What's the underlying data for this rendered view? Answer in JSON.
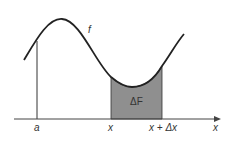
{
  "diagram": {
    "curve_label": "f",
    "area_label": "ΔF",
    "axis_label": "x",
    "ticks": [
      {
        "label": "a",
        "x": 37
      },
      {
        "label": "x",
        "x": 111
      },
      {
        "label": "x + Δx",
        "x": 162
      }
    ],
    "colors": {
      "line": "#222222",
      "fill": "#8f8f8f",
      "background": "#ffffff"
    }
  }
}
